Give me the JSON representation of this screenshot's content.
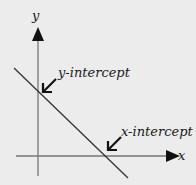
{
  "diagram": {
    "axes": {
      "x_label": "x",
      "y_label": "y"
    },
    "annotations": {
      "y_intercept": "y-intercept",
      "x_intercept": "x-intercept"
    },
    "colors": {
      "background": "#ececec",
      "axis": "#777777",
      "line": "#333333",
      "arrow": "#111111",
      "text": "#1a1a1a"
    }
  }
}
